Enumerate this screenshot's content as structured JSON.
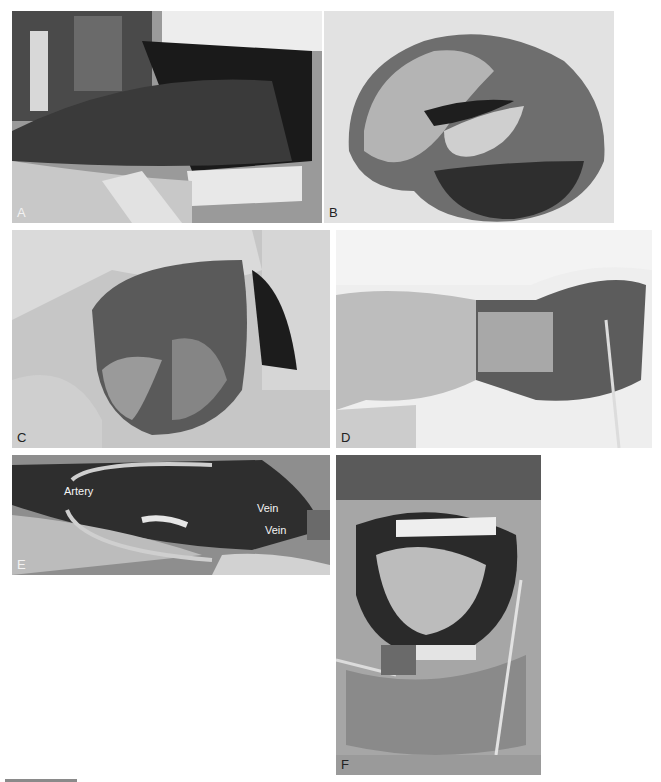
{
  "figure": {
    "panels": [
      {
        "id": "A",
        "label": "A",
        "description": "Intraoral view of tongue lesion with retractor"
      },
      {
        "id": "B",
        "label": "B",
        "description": "Resected specimen"
      },
      {
        "id": "C",
        "label": "C",
        "description": "Neck dissection field"
      },
      {
        "id": "D",
        "label": "D",
        "description": "Forearm flap harvest"
      },
      {
        "id": "E",
        "label": "E",
        "description": "Flap pedicle vessels",
        "annotations": [
          "Artery",
          "Vein",
          "Vein"
        ]
      },
      {
        "id": "F",
        "label": "F",
        "description": "Postoperative intraoral view with flap inset"
      }
    ]
  }
}
